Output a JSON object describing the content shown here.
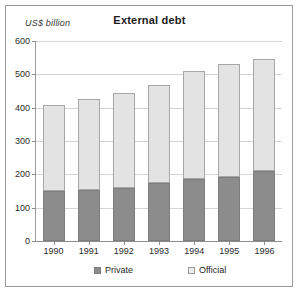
{
  "chart_data": {
    "type": "bar",
    "stacked": true,
    "title": "External debt",
    "ylabel": "US$  billion",
    "xlabel": "",
    "categories": [
      "1990",
      "1991",
      "1992",
      "1993",
      "1994",
      "1995",
      "1996"
    ],
    "series": [
      {
        "name": "Private",
        "values": [
          150,
          152,
          160,
          175,
          185,
          193,
          210
        ],
        "color": "#8c8c8c"
      },
      {
        "name": "Official",
        "values": [
          258,
          273,
          283,
          293,
          325,
          337,
          336
        ],
        "color": "#e3e3e3"
      }
    ],
    "totals": [
      408,
      425,
      443,
      468,
      510,
      530,
      546
    ],
    "ylim": [
      0,
      600
    ],
    "yticks": [
      0,
      100,
      200,
      300,
      400,
      500,
      600
    ],
    "ytick_labels": [
      "0",
      "100",
      "200",
      "300",
      "400",
      "500",
      "600"
    ],
    "grid": true,
    "legend_position": "bottom"
  },
  "legend": {
    "items": [
      {
        "label": "Private",
        "swatch": "dark-gray"
      },
      {
        "label": "Official",
        "swatch": "light-gray"
      }
    ]
  }
}
